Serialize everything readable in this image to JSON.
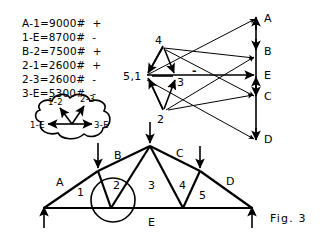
{
  "figure": {
    "caption": "Fig. 3",
    "force_list": [
      "A-1=9000#  +",
      "1-E=8700#  -",
      "B-2=7500#  +",
      "2-1=2600#  +",
      "2-3=2600#  -",
      "3-E=5300#  -"
    ]
  },
  "callout": {
    "name": "joint-detail-cloud",
    "labels": {
      "up_left": "1-2",
      "up_right": "2-3",
      "left": "1-E",
      "right": "3-E"
    }
  },
  "maxwell": {
    "load_line_labels": [
      "A",
      "B",
      "E",
      "C",
      "D"
    ],
    "vertex_labels": {
      "left": "5,1",
      "top": "4",
      "bottom": "2",
      "middle": "3"
    },
    "sign_marks": [
      "-",
      "-"
    ]
  },
  "truss": {
    "chord_labels": [
      "A",
      "B",
      "C",
      "D"
    ],
    "bottom_label": "E",
    "panel_labels": [
      "1",
      "2",
      "3",
      "4",
      "5"
    ]
  },
  "colors": {
    "ink": "#000000",
    "paper": "#ffffff"
  }
}
